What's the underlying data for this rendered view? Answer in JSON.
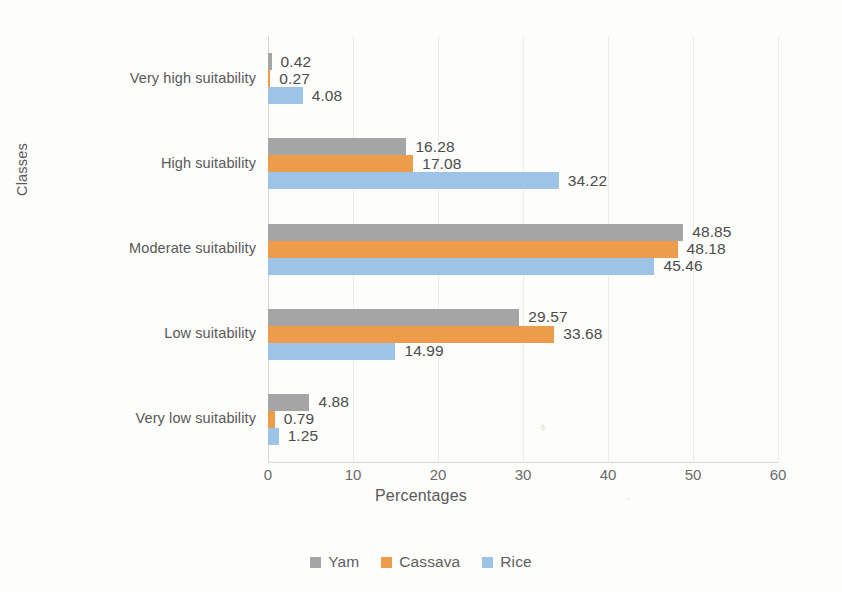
{
  "chart_data": {
    "type": "bar",
    "orientation": "horizontal",
    "title": "",
    "xlabel": "Percentages",
    "ylabel": "Classes",
    "xlim": [
      0,
      60
    ],
    "xticks": [
      0,
      10,
      20,
      30,
      40,
      50,
      60
    ],
    "grid": true,
    "legend_position": "bottom",
    "categories": [
      "Very high suitability",
      "High suitability",
      "Moderate suitability",
      "Low suitability",
      "Very low suitability"
    ],
    "series": [
      {
        "name": "Yam",
        "color": "#a5a5a5",
        "values": [
          0.42,
          16.28,
          48.85,
          29.57,
          4.88
        ]
      },
      {
        "name": "Cassava",
        "color": "#ed9c4b",
        "values": [
          0.27,
          17.08,
          48.18,
          33.68,
          0.79
        ]
      },
      {
        "name": "Rice",
        "color": "#9dc3e6",
        "values": [
          4.08,
          34.22,
          45.46,
          14.99,
          1.25
        ]
      }
    ],
    "data_labels": [
      [
        "0.42",
        "0.27",
        "4.08"
      ],
      [
        "16.28",
        "17.08",
        "34.22"
      ],
      [
        "48.85",
        "48.18",
        "45.46"
      ],
      [
        "29.57",
        "33.68",
        "14.99"
      ],
      [
        "4.88",
        "0.79",
        "1.25"
      ]
    ]
  },
  "axis": {
    "x_title": "Percentages",
    "y_title": "Classes",
    "x_tick_labels": [
      "0",
      "10",
      "20",
      "30",
      "40",
      "50",
      "60"
    ]
  },
  "legend": {
    "items": [
      {
        "label": "Yam",
        "color": "#a5a5a5"
      },
      {
        "label": "Cassava",
        "color": "#ed9c4b"
      },
      {
        "label": "Rice",
        "color": "#9dc3e6"
      }
    ]
  }
}
